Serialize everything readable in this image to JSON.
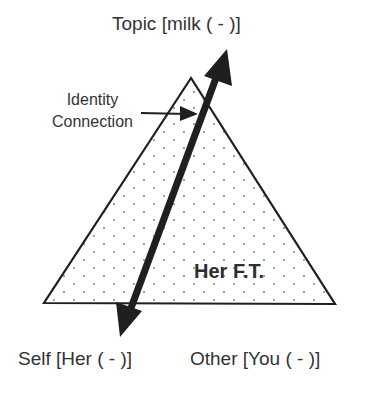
{
  "diagram": {
    "type": "triangle",
    "vertices": {
      "top": {
        "label": "Topic [milk ( - )]"
      },
      "bottom_left": {
        "label": "Self [Her ( - )]"
      },
      "bottom_right": {
        "label": "Other [You ( - )]"
      }
    },
    "center_label": "Her F.T.",
    "annotation": {
      "line1": "Identity",
      "line2": "Connection"
    },
    "connection_arrow": {
      "from": "Self",
      "to": "Topic",
      "style": "double-headed"
    },
    "fill_pattern": "dotted",
    "colors": {
      "stroke": "#1f1f1f",
      "text": "#333333",
      "dots": "#8a8a8a",
      "background": "#ffffff"
    }
  }
}
